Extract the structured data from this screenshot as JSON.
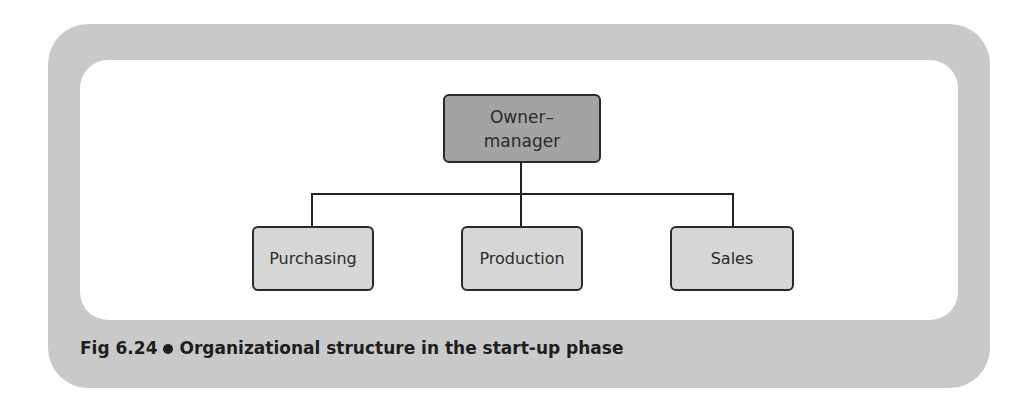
{
  "diagram": {
    "type": "org-chart",
    "root": {
      "label_line1": "Owner–",
      "label_line2": "manager"
    },
    "children": [
      {
        "label": "Purchasing"
      },
      {
        "label": "Production"
      },
      {
        "label": "Sales"
      }
    ]
  },
  "caption": {
    "fig_number": "Fig 6.24",
    "text": "Organizational structure in the start-up phase"
  },
  "colors": {
    "frame": "#c9c9c9",
    "root_fill": "#a3a3a3",
    "child_fill": "#d6d6d6",
    "line": "#222222"
  }
}
